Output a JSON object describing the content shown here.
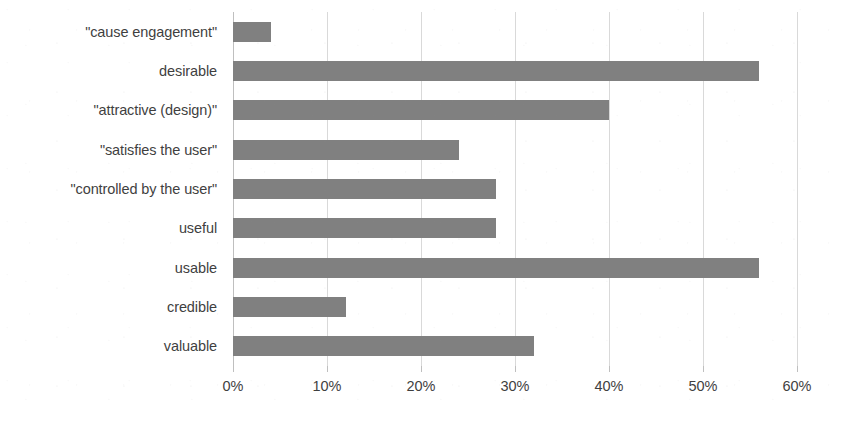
{
  "chart_data": {
    "type": "bar",
    "orientation": "horizontal",
    "title": "",
    "xlabel": "",
    "ylabel": "",
    "xlim": [
      0,
      60
    ],
    "xtick_labels": [
      "0%",
      "10%",
      "20%",
      "30%",
      "40%",
      "50%",
      "60%"
    ],
    "xtick_values": [
      0,
      10,
      20,
      30,
      40,
      50,
      60
    ],
    "grid": "vertical",
    "legend": "none",
    "value_suffix": "%",
    "bar_color": "#808080",
    "gridline_color": "#d9d9d9",
    "categories": [
      "\"cause engagement\"",
      "desirable",
      "\"attractive (design)\"",
      "\"satisfies the user\"",
      "\"controlled by the user\"",
      "useful",
      "usable",
      "credible",
      "valuable"
    ],
    "values": [
      4,
      56,
      40,
      24,
      28,
      28,
      56,
      12,
      32
    ],
    "bars": [
      {
        "label": "\"cause engagement\"",
        "value": 4
      },
      {
        "label": "desirable",
        "value": 56
      },
      {
        "label": "\"attractive (design)\"",
        "value": 40
      },
      {
        "label": "\"satisfies the user\"",
        "value": 24
      },
      {
        "label": "\"controlled by the user\"",
        "value": 28
      },
      {
        "label": "useful",
        "value": 28
      },
      {
        "label": "usable",
        "value": 56
      },
      {
        "label": "credible",
        "value": 12
      },
      {
        "label": "valuable",
        "value": 32
      }
    ]
  }
}
